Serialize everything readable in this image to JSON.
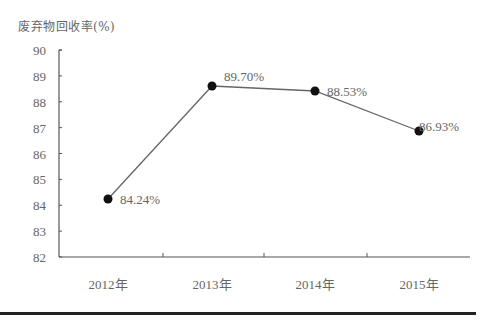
{
  "chart_data": {
    "type": "line",
    "title": "",
    "ylabel": "废弃物回收率(%)",
    "xlabel": "",
    "categories": [
      "2012年",
      "2013年",
      "2014年",
      "2015年"
    ],
    "series": [
      {
        "name": "废弃物回收率",
        "values": [
          84.24,
          89.7,
          88.53,
          86.93
        ],
        "labels": [
          "84.24%",
          "89.70%",
          "88.53%",
          "86.93%"
        ]
      }
    ],
    "ylim": [
      82,
      90
    ],
    "yticks": [
      "82",
      "83",
      "84",
      "85",
      "86",
      "87",
      "88",
      "89",
      "90"
    ],
    "grid": false,
    "legend": "none",
    "colors": {
      "line": "#555555",
      "marker": "#111111",
      "axis": "#555555"
    }
  }
}
